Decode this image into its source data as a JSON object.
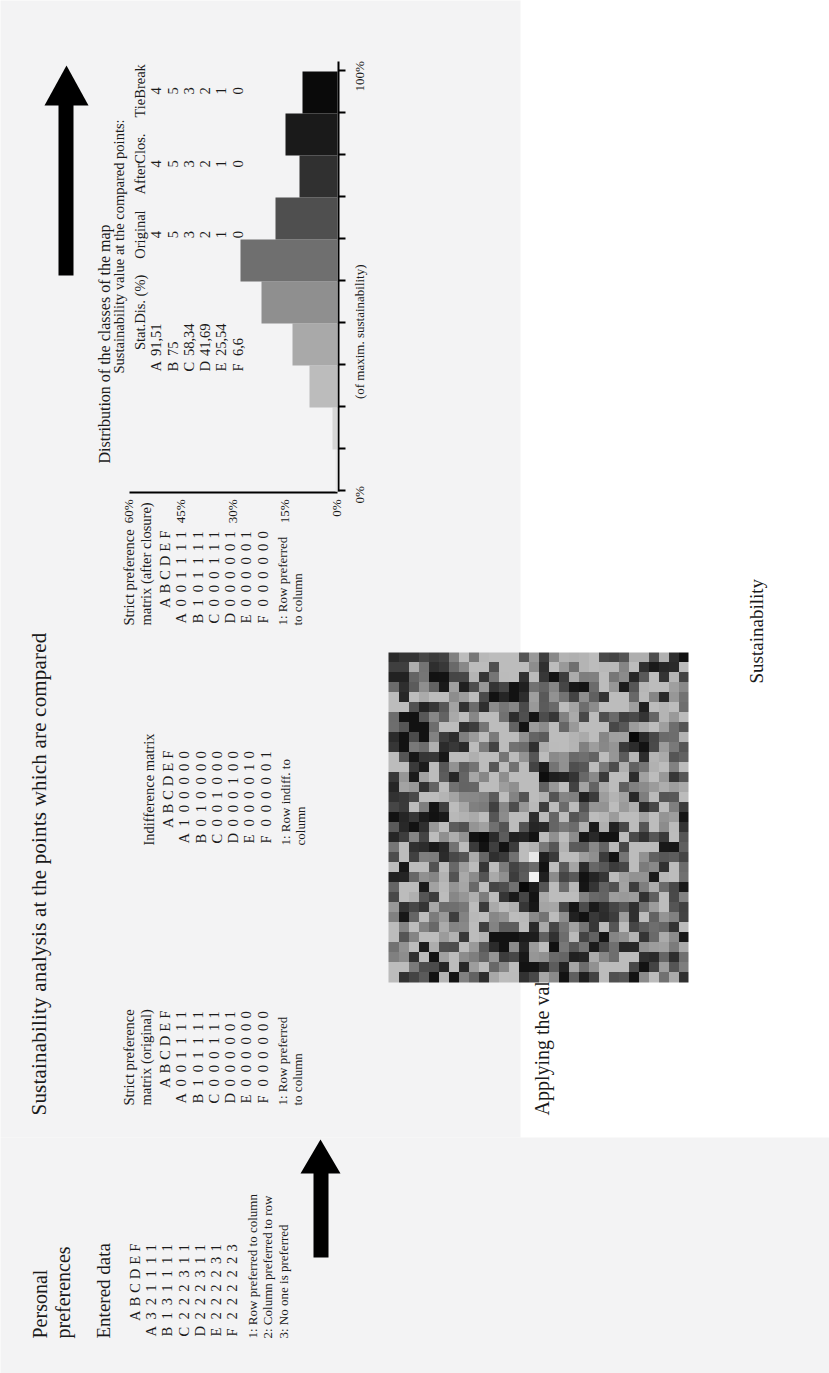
{
  "figure": {
    "main_title": "Sustainability analysis at the points which are compared",
    "sub_title": "Applying the value to the whole area",
    "map_caption": "Sustainability"
  },
  "personal": {
    "title": "Personal\npreferences",
    "entered_data_title": "Entered data",
    "col_headers": [
      "A",
      "B",
      "C",
      "D",
      "E",
      "F"
    ],
    "row_headers": [
      "A",
      "B",
      "C",
      "D",
      "E",
      "F"
    ],
    "rows": [
      [
        "3",
        "2",
        "1",
        "1",
        "1",
        "1"
      ],
      [
        "1",
        "3",
        "1",
        "1",
        "1",
        "1"
      ],
      [
        "2",
        "2",
        "2",
        "3",
        "1",
        "1"
      ],
      [
        "2",
        "2",
        "2",
        "3",
        "1",
        "1"
      ],
      [
        "2",
        "2",
        "2",
        "2",
        "3",
        "1"
      ],
      [
        "2",
        "2",
        "2",
        "2",
        "2",
        "3"
      ]
    ],
    "legend": "1: Row preferred to column\n2: Column preferred to row\n3: No one is preferred"
  },
  "strict_original": {
    "title": "Strict preference\nmatrix (original)",
    "col_headers": [
      "A",
      "B",
      "C",
      "D",
      "E",
      "F"
    ],
    "row_headers": [
      "A",
      "B",
      "C",
      "D",
      "E",
      "F"
    ],
    "rows": [
      [
        "0",
        "0",
        "1",
        "1",
        "1",
        "1"
      ],
      [
        "1",
        "0",
        "1",
        "1",
        "1",
        "1"
      ],
      [
        "0",
        "0",
        "0",
        "1",
        "1",
        "1"
      ],
      [
        "0",
        "0",
        "0",
        "0",
        "0",
        "1"
      ],
      [
        "0",
        "0",
        "0",
        "0",
        "0",
        "0"
      ],
      [
        "0",
        "0",
        "0",
        "0",
        "0",
        "0"
      ]
    ],
    "legend": "1: Row preferred\nto column"
  },
  "indifference": {
    "title": "Indifference matrix",
    "col_headers": [
      "A",
      "B",
      "C",
      "D",
      "E",
      "F"
    ],
    "row_headers": [
      "A",
      "B",
      "C",
      "D",
      "E",
      "F"
    ],
    "rows": [
      [
        "1",
        "0",
        "0",
        "0",
        "0",
        "0"
      ],
      [
        "0",
        "1",
        "0",
        "0",
        "0",
        "0"
      ],
      [
        "0",
        "0",
        "1",
        "0",
        "0",
        "0"
      ],
      [
        "0",
        "0",
        "0",
        "1",
        "0",
        "0"
      ],
      [
        "0",
        "0",
        "0",
        "0",
        "1",
        "0"
      ],
      [
        "0",
        "0",
        "0",
        "0",
        "0",
        "1"
      ]
    ],
    "legend": "1: Row indiff. to\ncolumn"
  },
  "strict_closure": {
    "title": "Strict preference\nmatrix (after closure)",
    "col_headers": [
      "A",
      "B",
      "C",
      "D",
      "E",
      "F"
    ],
    "row_headers": [
      "A",
      "B",
      "C",
      "D",
      "E",
      "F"
    ],
    "rows": [
      [
        "0",
        "0",
        "1",
        "1",
        "1",
        "1"
      ],
      [
        "1",
        "0",
        "1",
        "1",
        "1",
        "1"
      ],
      [
        "0",
        "0",
        "0",
        "1",
        "1",
        "1"
      ],
      [
        "0",
        "0",
        "0",
        "0",
        "0",
        "1"
      ],
      [
        "0",
        "0",
        "0",
        "0",
        "0",
        "1"
      ],
      [
        "0",
        "0",
        "0",
        "0",
        "0",
        "0"
      ]
    ],
    "legend": "1: Row preferred\nto column"
  },
  "sustainability_table": {
    "title": "Sustainability value at the compared points:",
    "columns": [
      "Stat.Dis. (%)",
      "Original",
      "AfterClos.",
      "TieBreak"
    ],
    "row_headers": [
      "A",
      "B",
      "C",
      "D",
      "E",
      "F"
    ],
    "rows": [
      [
        "91,51",
        "4",
        "4",
        "4"
      ],
      [
        "75",
        "5",
        "5",
        "5"
      ],
      [
        "58,34",
        "3",
        "3",
        "3"
      ],
      [
        "41,69",
        "2",
        "2",
        "2"
      ],
      [
        "25,54",
        "1",
        "1",
        "1"
      ],
      [
        "6,6",
        "0",
        "0",
        "0"
      ]
    ]
  },
  "chart_data": {
    "type": "bar",
    "title": "Distribution of the classes of the map",
    "xlabel": "0%  (of maxim. sustainability)  100%",
    "ylabel": "",
    "categories": [
      "0-10%",
      "10-20%",
      "20-30%",
      "30-40%",
      "40-50%",
      "50-60%",
      "60-70%",
      "70-80%",
      "80-90%",
      "90-100%"
    ],
    "values": [
      0.5,
      1.5,
      8,
      13,
      22,
      28,
      18,
      11,
      15,
      10
    ],
    "bar_colors": [
      "#e9e9e9",
      "#d6d6d6",
      "#bcbcbc",
      "#a9a9a9",
      "#8f8f8f",
      "#6f6f6f",
      "#4f4f4f",
      "#303030",
      "#1a1a1a",
      "#0a0a0a"
    ],
    "ytick_labels": [
      "0%",
      "15%",
      "30%",
      "45%",
      "60%"
    ],
    "ytick_values": [
      0,
      15,
      30,
      45,
      60
    ],
    "ylim": [
      0,
      60
    ],
    "grid": false,
    "legend_position": "none",
    "x_axis_left_label": "0%",
    "x_axis_mid_label": "(of maxim. sustainability)",
    "x_axis_right_label": "100%"
  },
  "map": {
    "name": "sustainability-raster-map",
    "alt": "Greyscale raster map of sustainability values"
  },
  "arrows": {
    "left_arrow_name": "flow-arrow-to-analysis",
    "right_arrow_name": "flow-arrow-to-map"
  }
}
